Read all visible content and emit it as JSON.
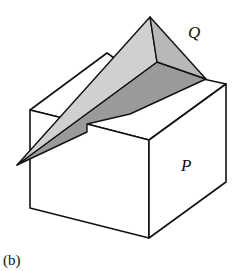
{
  "figure": {
    "panel_label": "(b)",
    "labels": {
      "wedge": "Q",
      "box": "P"
    },
    "colors": {
      "stroke": "#111111",
      "box_face": "#ffffff",
      "wedge_light": "#d2d2d2",
      "wedge_mid": "#bdbdbd",
      "wedge_dark": "#9a9a9a"
    }
  }
}
